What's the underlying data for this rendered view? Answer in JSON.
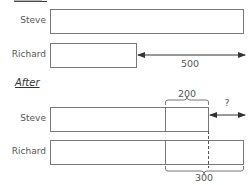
{
  "sections": {
    "before": {
      "title": "Before"
    },
    "after": {
      "title": "After"
    }
  },
  "before": {
    "rows": [
      {
        "name": "Steve"
      },
      {
        "name": "Richard"
      }
    ],
    "difference_label": "500"
  },
  "after": {
    "rows": [
      {
        "name": "Steve"
      },
      {
        "name": "Richard"
      }
    ],
    "steve_added_label": "200",
    "unknown_label": "?",
    "richard_added_label": "300"
  },
  "colors": {
    "stroke": "#666666",
    "text": "#555555"
  }
}
